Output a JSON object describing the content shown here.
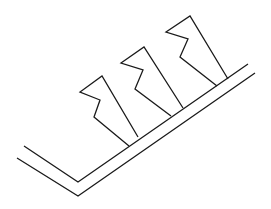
{
  "diagram": {
    "stroke_color": "#1a1a1a",
    "background": "#ffffff",
    "base": {
      "outer_line": "17,158 78,196 255,73",
      "inner_line": "24,146 78,182 248,64"
    },
    "fins": [
      {
        "outer_path": "129,146 94,117 100,100 80,92 102,76 138,137",
        "label": ""
      },
      {
        "outer_path": "171,116 135,89 143,70 121,63 144,47 183,108",
        "label": ""
      },
      {
        "outer_path": "217,86 180,57 188,39 166,32 190,16 228,79",
        "label": ""
      }
    ]
  }
}
